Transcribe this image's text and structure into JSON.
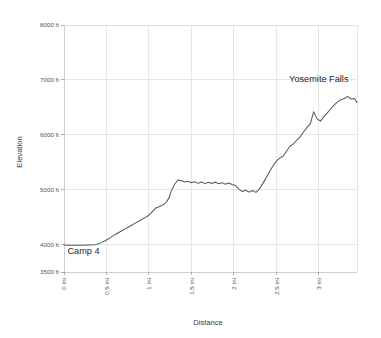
{
  "chart_data": {
    "type": "line",
    "title": "",
    "xlabel": "Distance",
    "ylabel": "Elevation",
    "xlim": [
      0,
      3.45
    ],
    "ylim": [
      3500,
      8000
    ],
    "grid": true,
    "legend": "none",
    "x_tick_labels": [
      "0 mi",
      "0.5 mi",
      "1 mi",
      "1.5 mi",
      "2 mi",
      "2.5 mi",
      "3 mi"
    ],
    "x_tick_values": [
      0,
      0.5,
      1,
      1.5,
      2,
      2.5,
      3
    ],
    "y_tick_labels": [
      "3500 ft",
      "4000 ft",
      "5000 ft",
      "6000 ft",
      "7000 ft",
      "8000 ft"
    ],
    "y_tick_values": [
      3500,
      4000,
      5000,
      6000,
      7000,
      8000
    ],
    "annotations": [
      {
        "text": "Camp 4",
        "x": 0.04,
        "y": 3830,
        "align": "start"
      },
      {
        "text": "Yosemite Falls",
        "x": 3.35,
        "y": 6960,
        "align": "end"
      }
    ],
    "series": [
      {
        "name": "Yosemite Falls Trail elevation profile",
        "color": "#595959",
        "x": [
          0,
          0.04,
          0.08,
          0.12,
          0.16,
          0.2,
          0.24,
          0.28,
          0.32,
          0.36,
          0.4,
          0.44,
          0.48,
          0.52,
          0.56,
          0.6,
          0.64,
          0.68,
          0.72,
          0.76,
          0.8,
          0.84,
          0.88,
          0.92,
          0.96,
          1.0,
          1.04,
          1.08,
          1.12,
          1.16,
          1.2,
          1.24,
          1.26,
          1.3,
          1.34,
          1.38,
          1.42,
          1.46,
          1.5,
          1.54,
          1.58,
          1.62,
          1.66,
          1.7,
          1.74,
          1.78,
          1.82,
          1.86,
          1.9,
          1.94,
          1.98,
          2.02,
          2.06,
          2.1,
          2.14,
          2.18,
          2.22,
          2.26,
          2.3,
          2.34,
          2.38,
          2.42,
          2.46,
          2.5,
          2.54,
          2.58,
          2.62,
          2.66,
          2.7,
          2.74,
          2.78,
          2.82,
          2.86,
          2.9,
          2.94,
          2.98,
          3.02,
          3.06,
          3.1,
          3.14,
          3.18,
          3.22,
          3.26,
          3.3,
          3.34,
          3.38,
          3.42,
          3.45
        ],
        "y": [
          3990,
          3988,
          3987,
          3986,
          3986,
          3987,
          3988,
          3990,
          3993,
          3998,
          4010,
          4035,
          4065,
          4100,
          4140,
          4180,
          4215,
          4250,
          4285,
          4320,
          4355,
          4390,
          4425,
          4460,
          4495,
          4535,
          4600,
          4665,
          4690,
          4720,
          4760,
          4860,
          4960,
          5090,
          5175,
          5165,
          5140,
          5155,
          5125,
          5145,
          5115,
          5140,
          5110,
          5135,
          5112,
          5138,
          5108,
          5128,
          5100,
          5120,
          5095,
          5075,
          5010,
          4965,
          4990,
          4955,
          4985,
          4950,
          5010,
          5110,
          5215,
          5330,
          5430,
          5520,
          5575,
          5610,
          5700,
          5790,
          5830,
          5900,
          5960,
          6050,
          6130,
          6200,
          6420,
          6290,
          6250,
          6330,
          6400,
          6470,
          6540,
          6600,
          6640,
          6660,
          6700,
          6650,
          6660,
          6590
        ]
      }
    ]
  }
}
